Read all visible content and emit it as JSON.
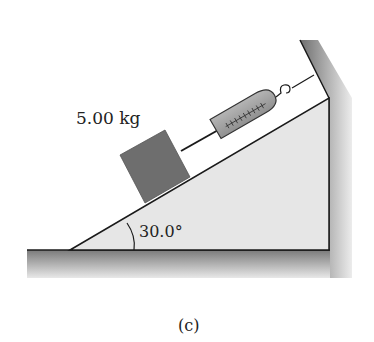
{
  "diagram": {
    "mass_label": "5.00 kg",
    "angle_label": "30.0°",
    "caption": "(c)",
    "incline_angle_deg": 30.0,
    "mass_kg": 5.0,
    "objects": [
      "block",
      "string",
      "spring-scale",
      "hook",
      "incline",
      "wall",
      "ground"
    ]
  },
  "colors": {
    "incline_fill": "#e6e6e6",
    "block_fill": "#6e6e6e",
    "scale_fill": "#a9a9a9",
    "ground_shade": "#8a8a8a",
    "line": "#1a1a1a"
  }
}
